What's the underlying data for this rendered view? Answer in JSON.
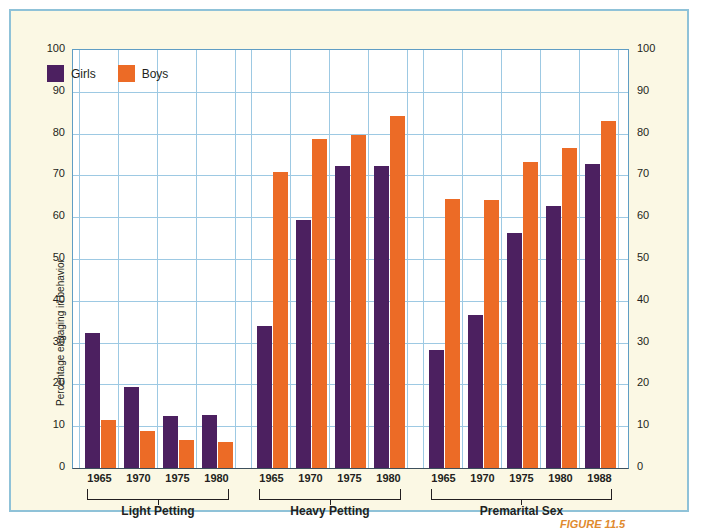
{
  "chart_data": {
    "type": "bar",
    "title": "",
    "xlabel": "",
    "ylabel": "Percentage engaging in behavior",
    "ylim": [
      0,
      100
    ],
    "ytick_values": [
      0,
      10,
      20,
      30,
      40,
      50,
      60,
      70,
      80,
      90,
      100
    ],
    "ytick_labels": [
      "0",
      "10",
      "20",
      "30",
      "40",
      "50",
      "60",
      "70",
      "80",
      "90",
      "100"
    ],
    "grid": true,
    "legend_position": "upper-left",
    "legend": [
      {
        "name": "Girls",
        "color": "#4c2060"
      },
      {
        "name": "Boys",
        "color": "#ec6b26"
      }
    ],
    "series": [
      {
        "name": "Girls",
        "color": "#4c2060",
        "values": [
          32.3,
          19.4,
          12.5,
          12.7,
          34.0,
          59.4,
          72.2,
          72.3,
          28.2,
          36.6,
          56.2,
          62.7,
          72.8
        ]
      },
      {
        "name": "Boys",
        "color": "#ec6b26",
        "values": [
          11.5,
          8.9,
          6.8,
          6.2,
          70.9,
          78.8,
          79.7,
          84.2,
          64.4,
          64.2,
          73.2,
          76.5,
          83.0
        ]
      }
    ],
    "categories": [
      "1965",
      "1970",
      "1975",
      "1980",
      "1965",
      "1970",
      "1975",
      "1980",
      "1965",
      "1970",
      "1975",
      "1980",
      "1988"
    ],
    "groups": [
      {
        "label": "Light Petting",
        "start": 0,
        "count": 4
      },
      {
        "label": "Heavy Petting",
        "start": 4,
        "count": 4
      },
      {
        "label": "Premarital Sex",
        "start": 8,
        "count": 5
      }
    ]
  },
  "figure": {
    "caption": "FIGURE 11.5",
    "panel_background": "#fbf8e4",
    "panel_border": "#8fc2d8",
    "plot_background": "#ffffff",
    "gridline_color": "#9dc9e3"
  }
}
